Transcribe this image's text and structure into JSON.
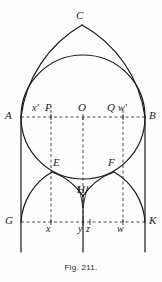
{
  "figure": {
    "caption": "Fig. 211.",
    "colors": {
      "background": "#fefefe",
      "stroke": "#1a1a1a",
      "dashed": "#3a3a3a",
      "label": "#1a1a1a"
    },
    "stroke_width": 1.1,
    "dash_pattern": "3,2.5"
  },
  "labels": {
    "C": "C",
    "A": "A",
    "B": "B",
    "O": "O",
    "P": "P",
    "Q": "Q",
    "xprime": "x'",
    "wprime": "w'",
    "E": "E",
    "F": "F",
    "H": "H",
    "G": "G",
    "K": "K",
    "x": "x",
    "y": "y",
    "z": "z",
    "w": "w"
  },
  "points": {
    "C": {
      "label": "C",
      "x": 82,
      "y": 25,
      "label_x": 76,
      "label_y": 10
    },
    "A": {
      "label": "A",
      "x": 21,
      "y": 117,
      "label_x": 6,
      "label_y": 111
    },
    "B": {
      "label": "B",
      "x": 145,
      "y": 117,
      "label_x": 149,
      "label_y": 111
    },
    "O": {
      "label": "O",
      "x": 83,
      "y": 117,
      "label_x": 78,
      "label_y": 103
    },
    "P": {
      "label": "P",
      "x": 52,
      "y": 117,
      "label_x": 46,
      "label_y": 103
    },
    "Q": {
      "label": "Q",
      "x": 114,
      "y": 117,
      "label_x": 108,
      "label_y": 103
    },
    "xprime": {
      "label": "x'",
      "x": 51,
      "y": 117,
      "label_x": 33,
      "label_y": 103
    },
    "wprime": {
      "label": "w'",
      "x": 123,
      "y": 117,
      "label_x": 119,
      "label_y": 103
    },
    "E": {
      "label": "E",
      "x": 52,
      "y": 172,
      "label_x": 54,
      "label_y": 158
    },
    "F": {
      "label": "F",
      "x": 114,
      "y": 172,
      "label_x": 109,
      "label_y": 158
    },
    "H": {
      "label": "H",
      "x": 83,
      "y": 196,
      "label_x": 78,
      "label_y": 185
    },
    "G": {
      "label": "G",
      "x": 21,
      "y": 222,
      "label_x": 6,
      "label_y": 216
    },
    "K": {
      "label": "K",
      "x": 145,
      "y": 222,
      "label_x": 149,
      "label_y": 216
    },
    "x": {
      "label": "x",
      "x": 51,
      "y": 222,
      "label_x": 47,
      "label_y": 225
    },
    "y": {
      "label": "y",
      "x": 83,
      "y": 222,
      "label_x": 79,
      "label_y": 225
    },
    "z": {
      "label": "z",
      "x": 90,
      "y": 222,
      "label_x": 87,
      "label_y": 225
    },
    "w": {
      "label": "w",
      "x": 123,
      "y": 222,
      "label_x": 118,
      "label_y": 225
    }
  },
  "geometry": {
    "baseline_AB_y": 117,
    "baseline_GK_y": 222,
    "left_jamb_x": 21,
    "right_jamb_x": 145,
    "center_x": 83,
    "main_circle": {
      "cx": 83,
      "cy": 117,
      "r": 62
    },
    "pointed_arch_apex": {
      "x": 82,
      "y": 25
    },
    "small_arch_left": {
      "cx": 52,
      "cy": 222,
      "r": 31
    },
    "small_arch_right": {
      "cx": 114,
      "cy": 222,
      "r": 31
    },
    "jamb_bottom_y": 252,
    "center_line_bottom_y": 252
  }
}
